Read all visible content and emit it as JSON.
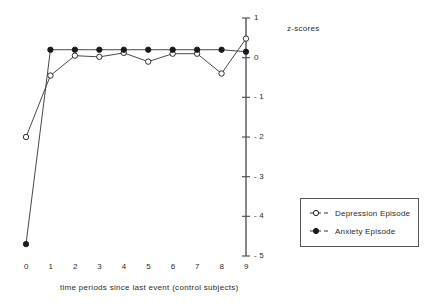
{
  "chart_data": {
    "type": "line",
    "title": "",
    "xlabel": "time periods since last event (control subjects)",
    "ylabel": "z-scores",
    "x": [
      0,
      1,
      2,
      3,
      4,
      5,
      6,
      7,
      8,
      9
    ],
    "categories": [
      "0",
      "1",
      "2",
      "3",
      "4",
      "5",
      "6",
      "7",
      "8",
      "9"
    ],
    "xlim": [
      0,
      9
    ],
    "ylim": [
      -5,
      1
    ],
    "yticks": [
      1,
      0,
      -1,
      -2,
      -3,
      -4,
      -5
    ],
    "ytick_labels": [
      "1",
      "0",
      "- 1",
      "- 2",
      "- 3",
      "- 4",
      "- 5"
    ],
    "grid": false,
    "legend_position": "right-lower",
    "series": [
      {
        "name": "Depression Episode",
        "marker": "open-circle",
        "values": [
          -2.0,
          -0.45,
          0.05,
          0.02,
          0.12,
          -0.1,
          0.1,
          0.1,
          -0.4,
          0.48
        ]
      },
      {
        "name": "Anxiety Episode",
        "marker": "filled-circle",
        "values": [
          -4.7,
          0.2,
          0.2,
          0.2,
          0.2,
          0.2,
          0.2,
          0.2,
          0.2,
          0.15
        ]
      }
    ]
  },
  "axis": {
    "y_axis_title": "z-scores",
    "x_axis_caption": "time periods since last event (control subjects)",
    "x_tick_labels": [
      "0",
      "1",
      "2",
      "3",
      "4",
      "5",
      "6",
      "7",
      "8",
      "9"
    ],
    "y_tick_labels": [
      "1",
      "0",
      "- 1",
      "- 2",
      "- 3",
      "- 4",
      "- 5"
    ]
  },
  "legend": {
    "entries": [
      {
        "label": "Depression Episode",
        "marker": "open-circle"
      },
      {
        "label": "Anxiety Episode",
        "marker": "filled-circle"
      }
    ]
  },
  "colors": {
    "line": "#333333",
    "axis": "#555555",
    "text": "#2b2b2b",
    "marker_fill_open": "#ffffff",
    "marker_fill_closed": "#1a1a1a"
  }
}
